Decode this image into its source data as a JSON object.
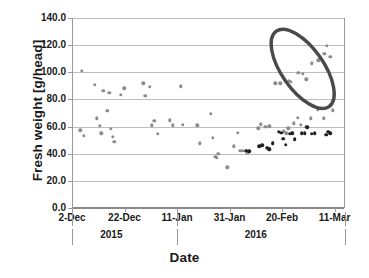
{
  "chart_data": {
    "type": "scatter",
    "title": "",
    "xlabel": "Date",
    "ylabel": "Fresh weight [g/head]",
    "ylim": [
      0.0,
      140.0
    ],
    "y_ticks": [
      "0.0",
      "20.0",
      "40.0",
      "60.0",
      "80.0",
      "100.0",
      "120.0",
      "140.0"
    ],
    "y_tick_values": [
      0,
      20,
      40,
      60,
      80,
      100,
      120,
      140
    ],
    "grid": "horizontal",
    "legend": "none",
    "x_axis_type": "date",
    "x_range": [
      "2-Dec",
      "16-Mar"
    ],
    "x_ticks": [
      "2-Dec",
      "22-Dec",
      "11-Jan",
      "31-Jan",
      "20-Feb",
      "11-Mar"
    ],
    "x_tick_day_offsets": [
      0,
      20,
      40,
      60,
      80,
      100
    ],
    "x_group_labels": [
      {
        "label": "2015",
        "day_offset": 15
      },
      {
        "label": "2016",
        "day_offset": 70
      }
    ],
    "x_group_separators": [
      0,
      40,
      104
    ],
    "series": [
      {
        "name": "fresh-weight-light",
        "color": "#8c8c8c",
        "marker": "circle",
        "points": [
          {
            "day": 3.4,
            "value": 101.0
          },
          {
            "day": 2.8,
            "value": 57.3
          },
          {
            "day": 4.2,
            "value": 53.0
          },
          {
            "day": 8.2,
            "value": 90.8
          },
          {
            "day": 9.0,
            "value": 66.0
          },
          {
            "day": 10.2,
            "value": 60.5
          },
          {
            "day": 10.8,
            "value": 55.0
          },
          {
            "day": 11.6,
            "value": 86.3
          },
          {
            "day": 13.0,
            "value": 71.5
          },
          {
            "day": 13.8,
            "value": 85.0
          },
          {
            "day": 14.4,
            "value": 58.2
          },
          {
            "day": 15.2,
            "value": 52.5
          },
          {
            "day": 15.8,
            "value": 48.8
          },
          {
            "day": 18.3,
            "value": 83.5
          },
          {
            "day": 19.6,
            "value": 88.3
          },
          {
            "day": 26.8,
            "value": 92.0
          },
          {
            "day": 27.5,
            "value": 82.8
          },
          {
            "day": 29.3,
            "value": 89.5
          },
          {
            "day": 30.0,
            "value": 60.8
          },
          {
            "day": 31.0,
            "value": 64.2
          },
          {
            "day": 32.2,
            "value": 54.5
          },
          {
            "day": 36.8,
            "value": 64.5
          },
          {
            "day": 38.0,
            "value": 61.0
          },
          {
            "day": 41.0,
            "value": 89.7
          },
          {
            "day": 41.8,
            "value": 61.4
          },
          {
            "day": 47.3,
            "value": 60.8
          },
          {
            "day": 48.2,
            "value": 47.8
          },
          {
            "day": 52.5,
            "value": 69.5
          },
          {
            "day": 53.2,
            "value": 51.8
          },
          {
            "day": 54.2,
            "value": 37.8
          },
          {
            "day": 54.8,
            "value": 36.8
          },
          {
            "day": 55.4,
            "value": 39.8
          },
          {
            "day": 58.8,
            "value": 30.0
          },
          {
            "day": 61.3,
            "value": 45.5
          },
          {
            "day": 62.8,
            "value": 55.2
          },
          {
            "day": 63.8,
            "value": 42.0
          },
          {
            "day": 64.6,
            "value": 42.3
          },
          {
            "day": 66.4,
            "value": 40.8
          },
          {
            "day": 70.6,
            "value": 58.8
          },
          {
            "day": 71.6,
            "value": 61.8
          },
          {
            "day": 73.3,
            "value": 59.8
          },
          {
            "day": 74.8,
            "value": 60.2
          },
          {
            "day": 74.2,
            "value": 43.5
          },
          {
            "day": 75.0,
            "value": 43.2
          },
          {
            "day": 76.2,
            "value": 48.0
          },
          {
            "day": 80.4,
            "value": 56.5
          },
          {
            "day": 81.2,
            "value": 55.0
          },
          {
            "day": 82.0,
            "value": 58.8
          },
          {
            "day": 84.0,
            "value": 62.5
          },
          {
            "day": 85.6,
            "value": 66.5
          },
          {
            "day": 86.8,
            "value": 61.5
          },
          {
            "day": 88.6,
            "value": 60.0
          },
          {
            "day": 90.6,
            "value": 66.0
          },
          {
            "day": 93.2,
            "value": 72.8
          },
          {
            "day": 95.5,
            "value": 66.2
          },
          {
            "day": 99.0,
            "value": 72.0
          },
          {
            "day": 77.0,
            "value": 92.0
          },
          {
            "day": 79.0,
            "value": 91.8
          },
          {
            "day": 82.2,
            "value": 93.5
          },
          {
            "day": 83.0,
            "value": 92.8
          },
          {
            "day": 85.8,
            "value": 99.5
          },
          {
            "day": 87.6,
            "value": 98.8
          },
          {
            "day": 88.9,
            "value": 94.8
          },
          {
            "day": 91.0,
            "value": 106.5
          },
          {
            "day": 93.4,
            "value": 108.8
          },
          {
            "day": 95.8,
            "value": 113.5
          },
          {
            "day": 96.6,
            "value": 119.5
          },
          {
            "day": 98.0,
            "value": 111.2
          }
        ]
      },
      {
        "name": "fresh-weight-dark",
        "color": "#1f1f1f",
        "marker": "circle",
        "points": [
          {
            "day": 66.0,
            "value": 42.2
          },
          {
            "day": 67.2,
            "value": 41.8
          },
          {
            "day": 71.0,
            "value": 45.5
          },
          {
            "day": 72.0,
            "value": 46.3
          },
          {
            "day": 74.0,
            "value": 44.3
          },
          {
            "day": 74.8,
            "value": 43.2
          },
          {
            "day": 76.0,
            "value": 47.8
          },
          {
            "day": 78.4,
            "value": 56.2
          },
          {
            "day": 79.4,
            "value": 55.5
          },
          {
            "day": 80.0,
            "value": 51.0
          },
          {
            "day": 81.0,
            "value": 46.5
          },
          {
            "day": 82.6,
            "value": 54.8
          },
          {
            "day": 83.6,
            "value": 55.0
          },
          {
            "day": 84.4,
            "value": 50.5
          },
          {
            "day": 87.2,
            "value": 55.2
          },
          {
            "day": 88.2,
            "value": 55.0
          },
          {
            "day": 89.2,
            "value": 59.5
          },
          {
            "day": 91.0,
            "value": 54.8
          },
          {
            "day": 92.0,
            "value": 55.2
          },
          {
            "day": 96.4,
            "value": 54.0
          },
          {
            "day": 97.2,
            "value": 56.2
          },
          {
            "day": 98.0,
            "value": 55.0
          }
        ]
      }
    ],
    "annotations": [
      {
        "name": "highlight-ellipse",
        "shape": "ellipse",
        "color": "#4a4a4a",
        "stroke_width": 3.4,
        "center_day": 87.5,
        "center_value": 102.5,
        "rotation_deg": -35,
        "note": "encircles high fresh-weight cluster in late Feb - Mar 2016"
      }
    ]
  }
}
